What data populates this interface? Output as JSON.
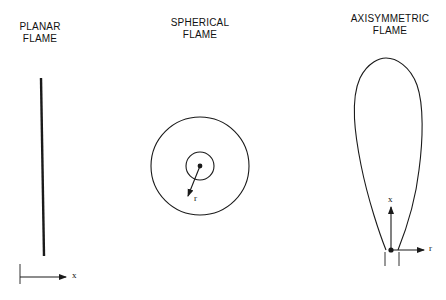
{
  "panels": {
    "planar": {
      "title_line1": "PLANAR",
      "title_line2": "FLAME",
      "axis_label": "x"
    },
    "spherical": {
      "title_line1": "SPHERICAL",
      "title_line2": "FLAME",
      "radius_label": "r"
    },
    "axisymmetric": {
      "title_line1": "AXISYMMETRIC",
      "title_line2": "FLAME",
      "axial_label": "x",
      "radial_label": "r"
    }
  },
  "colors": {
    "stroke": "#1a1a1a",
    "background": "#ffffff"
  }
}
